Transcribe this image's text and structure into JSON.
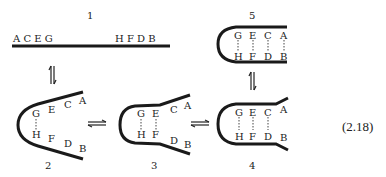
{
  "equation_number": "(2.18)",
  "states": [
    {
      "id": "1",
      "top_bases": [
        "A",
        "C",
        "E",
        "G"
      ],
      "bottom_bases": [
        "H",
        "F",
        "D",
        "B"
      ],
      "paired": []
    },
    {
      "id": "2",
      "top_bases": [
        "G",
        "E",
        "C",
        "A"
      ],
      "bottom_bases": [
        "H",
        "F",
        "D",
        "B"
      ],
      "paired": [
        "G-H"
      ]
    },
    {
      "id": "3",
      "top_bases": [
        "G",
        "E",
        "C",
        "A"
      ],
      "bottom_bases": [
        "H",
        "F",
        "D",
        "B"
      ],
      "paired": [
        "G-H",
        "E-F"
      ]
    },
    {
      "id": "4",
      "top_bases": [
        "G",
        "E",
        "C",
        "A"
      ],
      "bottom_bases": [
        "H",
        "F",
        "D",
        "B"
      ],
      "paired": [
        "G-H",
        "E-F",
        "C-D"
      ]
    },
    {
      "id": "5",
      "top_bases": [
        "G",
        "E",
        "C",
        "A"
      ],
      "bottom_bases": [
        "H",
        "F",
        "D",
        "B"
      ],
      "paired": [
        "G-H",
        "E-F",
        "C-D",
        "A-B"
      ]
    }
  ],
  "labels": {
    "s1": "1",
    "s2": "2",
    "s3": "3",
    "s4": "4",
    "s5": "5",
    "s1_left": "A C E G",
    "s1_right": "H F D B",
    "A": "A",
    "B": "B",
    "C": "C",
    "D": "D",
    "E": "E",
    "F": "F",
    "G": "G",
    "H": "H"
  }
}
